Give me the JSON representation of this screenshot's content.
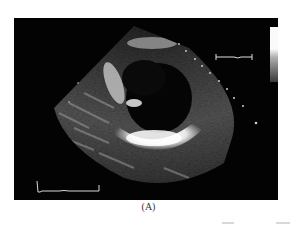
{
  "figure": {
    "caption": "(A)",
    "panel": {
      "background": "#030303"
    },
    "grayscale_bar": {
      "top_color": "#fafafa",
      "bottom_color": "#3a3a3a"
    },
    "scale_marker_top_right": "bracket",
    "scale_marker_bottom_left": "ecg-bracket",
    "depth_markers": "dotted diagonal line"
  }
}
